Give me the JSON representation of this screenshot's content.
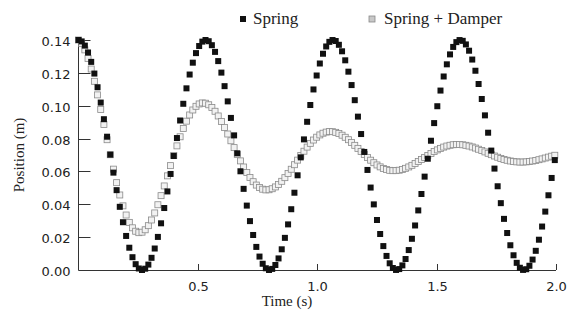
{
  "chart_data": {
    "type": "scatter",
    "title": "",
    "xlabel": "Time (s)",
    "ylabel": "Position (m)",
    "xlim": [
      0,
      2.0
    ],
    "ylim": [
      0,
      0.14
    ],
    "xticks": [
      0.5,
      1.0,
      1.5,
      2.0
    ],
    "xtick_labels": [
      "0.5",
      "1.0",
      "1.5",
      "2.0"
    ],
    "yticks": [
      0.0,
      0.02,
      0.04,
      0.06,
      0.08,
      0.1,
      0.12,
      0.14
    ],
    "ytick_labels": [
      "0.00",
      "0.02",
      "0.04",
      "0.06",
      "0.08",
      "0.10",
      "0.12",
      "0.14"
    ],
    "grid": false,
    "legend_position": "top",
    "sample_step": 0.0133,
    "series": [
      {
        "name": "Spring",
        "marker": "filled-square",
        "color": "#111111",
        "model": {
          "equilibrium": 0.07,
          "amplitude": 0.07,
          "period": 0.533,
          "decay": 0.0
        },
        "key_points": [
          [
            0.0,
            0.14
          ],
          [
            0.267,
            0.0
          ],
          [
            0.533,
            0.14
          ],
          [
            0.8,
            0.0
          ],
          [
            1.067,
            0.14
          ],
          [
            1.333,
            0.0
          ],
          [
            1.6,
            0.14
          ],
          [
            1.867,
            0.0
          ],
          [
            2.0,
            0.082
          ]
        ]
      },
      {
        "name": "Spring + Damper",
        "marker": "open-square",
        "color": "#b8b8b8",
        "model": {
          "equilibrium": 0.07,
          "amplitude": 0.07,
          "period": 0.533,
          "decay": 1.5
        },
        "key_points": [
          [
            0.0,
            0.14
          ],
          [
            0.267,
            0.023
          ],
          [
            0.533,
            0.101
          ],
          [
            0.8,
            0.051
          ],
          [
            1.067,
            0.083
          ],
          [
            1.333,
            0.06
          ],
          [
            1.6,
            0.075
          ],
          [
            1.867,
            0.065
          ],
          [
            2.0,
            0.07
          ]
        ]
      }
    ]
  }
}
